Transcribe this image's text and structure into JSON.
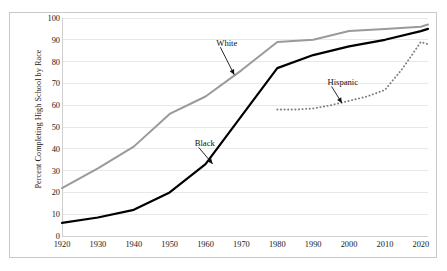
{
  "chart_data": {
    "type": "line",
    "title": "",
    "xlabel": "",
    "ylabel": "Percent Completing High School by Race",
    "xlim": [
      1920,
      2022
    ],
    "ylim": [
      0,
      100
    ],
    "ytick_step": 10,
    "grid": true,
    "legend_position": "inline-annotations",
    "categories": [
      1920,
      1930,
      1940,
      1950,
      1960,
      1970,
      1980,
      1990,
      2000,
      2010,
      2020
    ],
    "xticks": [
      "1920",
      "1930",
      "1940",
      "1950",
      "1960",
      "1970",
      "1980",
      "1990",
      "2000",
      "2010",
      "2020"
    ],
    "yticks": [
      "0",
      "10",
      "20",
      "30",
      "40",
      "50",
      "60",
      "70",
      "80",
      "90",
      "100"
    ],
    "series": [
      {
        "name": "White",
        "color": "#9a9a9a",
        "style": "solid",
        "x": [
          1920,
          1930,
          1940,
          1950,
          1960,
          1970,
          1980,
          1990,
          2000,
          2010,
          2020,
          2022
        ],
        "values": [
          22,
          31,
          41,
          56,
          64,
          76,
          89,
          90,
          94,
          95,
          96,
          97
        ]
      },
      {
        "name": "Black",
        "color": "#000000",
        "style": "solid",
        "x": [
          1920,
          1930,
          1940,
          1950,
          1960,
          1970,
          1980,
          1990,
          2000,
          2010,
          2020,
          2022
        ],
        "values": [
          6,
          8.5,
          12,
          20,
          33,
          55,
          77,
          83,
          87,
          90,
          94,
          95
        ]
      },
      {
        "name": "Hispanic",
        "color": "#7d7d7d",
        "style": "dotted",
        "x": [
          1980,
          1985,
          1990,
          1995,
          2000,
          2005,
          2010,
          2015,
          2020,
          2022
        ],
        "values": [
          58,
          58,
          58.5,
          60,
          62,
          64,
          67,
          77,
          89,
          88
        ]
      }
    ],
    "annotations": [
      {
        "label": "White",
        "text_x": 1963,
        "text_y": 88,
        "arrow_to_x": 1968,
        "arrow_to_y": 74
      },
      {
        "label": "Black",
        "text_x": 1957,
        "text_y": 42,
        "arrow_to_x": 1962,
        "arrow_to_y": 33
      },
      {
        "label": "Hispanic",
        "text_x": 1994,
        "text_y": 70,
        "arrow_to_x": 1998,
        "arrow_to_y": 61
      }
    ]
  },
  "colors": {
    "white_series": "#9a9a9a",
    "black_series": "#000000",
    "hispanic_series": "#7d7d7d",
    "gridline": "#e8e8e8",
    "axis": "#d0d0d0",
    "border": "#c9c9c9",
    "text": "#1a1a1a",
    "background": "#ffffff"
  }
}
